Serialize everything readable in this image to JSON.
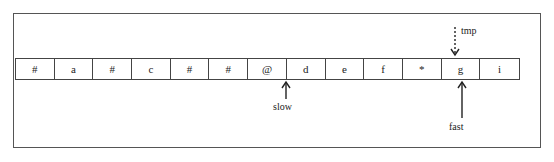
{
  "cells": [
    "#",
    "a",
    "#",
    "c",
    "#",
    "#",
    "@",
    "d",
    "e",
    "f",
    "*",
    "g",
    "i"
  ],
  "pointers": {
    "slow": {
      "label": "slow",
      "target_index": 7,
      "style": "solid",
      "direction": "up-from-below"
    },
    "fast": {
      "label": "fast",
      "target_index": 11,
      "style": "solid",
      "direction": "up-from-below"
    },
    "tmp": {
      "label": "tmp",
      "target_index": 11,
      "style": "dashed",
      "direction": "down-from-above"
    }
  },
  "colors": {
    "line": "#444444",
    "text": "#222222",
    "background": "#ffffff"
  }
}
